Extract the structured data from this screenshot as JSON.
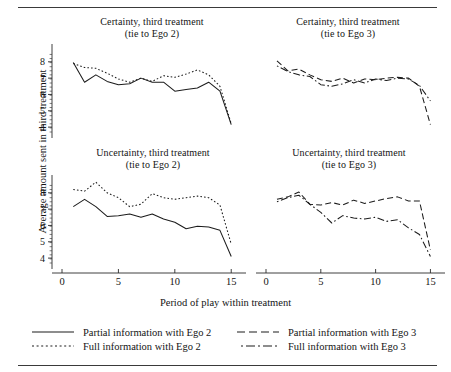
{
  "figure": {
    "ylabel": "Average amount sent in third treatment",
    "xlabel": "Period of play within treatment",
    "yticks": [
      "8",
      "7",
      "6",
      "5",
      "4"
    ],
    "xticks": [
      "0",
      "5",
      "10",
      "15"
    ]
  },
  "panels": [
    {
      "id": "certainty-ego2",
      "line1": "Certainty, third treatment",
      "line2": "(tie to Ego 2)"
    },
    {
      "id": "certainty-ego3",
      "line1": "Certainty, third treatment",
      "line2": "(tie to Ego 3)"
    },
    {
      "id": "uncertainty-ego2",
      "line1": "Uncertainty, third treatment",
      "line2": "(tie to Ego 2)"
    },
    {
      "id": "uncertainty-ego3",
      "line1": "Uncertainty, third treatment",
      "line2": "(tie to Ego 3)"
    }
  ],
  "legend": {
    "items": [
      {
        "label": "Partial information with Ego 2",
        "style": "solid",
        "key": "solid-line-key"
      },
      {
        "label": "Partial information with Ego 3",
        "style": "dashed",
        "key": "dashed-line-key"
      },
      {
        "label": "Full information with Ego 2",
        "style": "dotted",
        "key": "dotted-line-key"
      },
      {
        "label": "Full information with Ego 3",
        "style": "dashdot",
        "key": "dashdot-line-key"
      }
    ]
  },
  "chart_data": {
    "type": "line",
    "title": "",
    "xlabel": "Period of play within treatment",
    "ylabel": "Average amount sent in third treatment",
    "xlim": [
      0,
      15.6
    ],
    "ylim": [
      3.7,
      8.6
    ],
    "xticks": [
      0,
      5,
      10,
      15
    ],
    "yticks": [
      4,
      5,
      6,
      7,
      8
    ],
    "grid": false,
    "legend_position": "below",
    "panels": [
      {
        "name": "Certainty, third treatment (tie to Ego 2)",
        "x": [
          1,
          2,
          3,
          4,
          5,
          6,
          7,
          8,
          9,
          10,
          11,
          12,
          13,
          14,
          15
        ],
        "series": [
          {
            "name": "Partial information with Ego 2",
            "style": "solid",
            "values": [
              7.95,
              6.75,
              7.2,
              6.8,
              6.6,
              6.65,
              7.0,
              6.75,
              6.75,
              6.2,
              6.3,
              6.4,
              6.75,
              6.2,
              4.15
            ]
          },
          {
            "name": "Full information with Ego 2",
            "style": "dotted",
            "values": [
              7.9,
              7.65,
              7.6,
              7.3,
              6.95,
              6.75,
              7.0,
              6.8,
              7.15,
              7.05,
              7.25,
              7.5,
              7.2,
              6.5,
              4.2
            ]
          }
        ]
      },
      {
        "name": "Certainty, third treatment (tie to Ego 3)",
        "x": [
          1,
          2,
          3,
          4,
          5,
          6,
          7,
          8,
          9,
          10,
          11,
          12,
          13,
          14,
          15
        ],
        "series": [
          {
            "name": "Partial information with Ego 3",
            "style": "dashed",
            "values": [
              8.05,
              7.45,
              7.55,
              7.2,
              6.9,
              6.8,
              7.0,
              6.7,
              6.95,
              6.9,
              7.0,
              7.05,
              7.0,
              6.5,
              4.15
            ]
          },
          {
            "name": "Full information with Ego 3",
            "style": "dashdot",
            "values": [
              7.75,
              7.4,
              7.2,
              7.1,
              6.6,
              6.5,
              6.65,
              6.9,
              6.7,
              6.95,
              6.85,
              7.0,
              6.95,
              6.55,
              5.6
            ]
          }
        ]
      },
      {
        "name": "Uncertainty, third treatment (tie to Ego 2)",
        "x": [
          1,
          2,
          3,
          4,
          5,
          6,
          7,
          8,
          9,
          10,
          11,
          12,
          13,
          14,
          15
        ],
        "series": [
          {
            "name": "Partial information with Ego 2",
            "style": "solid",
            "values": [
              7.15,
              7.6,
              7.15,
              6.55,
              6.6,
              6.7,
              6.5,
              6.7,
              6.4,
              6.2,
              5.8,
              5.95,
              5.9,
              5.7,
              4.1
            ]
          },
          {
            "name": "Full information with Ego 2",
            "style": "dotted",
            "values": [
              8.2,
              8.1,
              8.65,
              8.0,
              7.7,
              7.15,
              7.3,
              7.95,
              7.7,
              7.6,
              7.7,
              7.8,
              7.7,
              7.25,
              4.85
            ]
          }
        ]
      },
      {
        "name": "Uncertainty, third treatment (tie to Ego 3)",
        "x": [
          1,
          2,
          3,
          4,
          5,
          6,
          7,
          8,
          9,
          10,
          11,
          12,
          13,
          14,
          15
        ],
        "series": [
          {
            "name": "Partial information with Ego 3",
            "style": "dashed",
            "values": [
              7.6,
              7.75,
              8.05,
              7.3,
              7.25,
              7.4,
              7.25,
              7.55,
              7.35,
              7.5,
              7.65,
              7.75,
              7.5,
              7.5,
              4.5
            ]
          },
          {
            "name": "Full information with Ego 3",
            "style": "dashdot",
            "values": [
              7.45,
              7.7,
              7.85,
              7.3,
              6.8,
              6.15,
              6.6,
              6.45,
              6.4,
              6.5,
              6.25,
              6.35,
              5.85,
              5.45,
              4.1
            ]
          }
        ]
      }
    ]
  }
}
